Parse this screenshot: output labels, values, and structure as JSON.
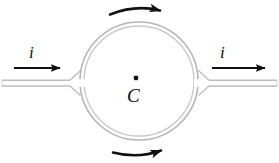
{
  "figure": {
    "type": "physics-diagram",
    "background_color": "#ffffff",
    "labels": {
      "current_left": "i",
      "current_right": "i",
      "center_point": "C"
    },
    "colors": {
      "tube_wall": "#b9b9b9",
      "tube_wall_inner": "#cfcfcf",
      "arrow": "#111111",
      "text": "#0d0d0d",
      "center_dot": "#111111"
    },
    "geometry": {
      "circle_center_x": 139,
      "circle_center_y": 81,
      "circle_radius": 59,
      "tube_wall_gap": 4,
      "inlet_pipe_y": 83,
      "inlet_pipe_left_x": 2,
      "outlet_pipe_right_x": 277
    },
    "arrows": {
      "straight_left": {
        "name": "current-arrow-left",
        "direction": "right",
        "x1": 14,
        "x2": 63,
        "y": 68
      },
      "straight_right": {
        "name": "current-arrow-right",
        "direction": "right",
        "x1": 212,
        "x2": 268,
        "y": 68
      },
      "curved_top": {
        "name": "circulation-arrow-top",
        "direction": "clockwise",
        "rotation_sense": "left-to-right"
      },
      "curved_bottom": {
        "name": "circulation-arrow-bottom",
        "direction": "clockwise",
        "rotation_sense": "left-to-right"
      }
    }
  }
}
